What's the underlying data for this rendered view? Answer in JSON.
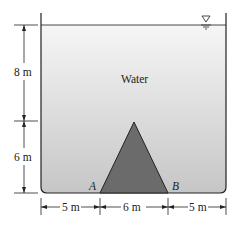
{
  "figure": {
    "fluid_label": "Water",
    "dimensions": {
      "upper_height": "8 m",
      "lower_height": "6 m",
      "left_width": "5 m",
      "middle_width": "6 m",
      "right_width": "5 m"
    },
    "points": {
      "left_base": "A",
      "right_base": "B"
    },
    "symbols": {
      "free_surface": "free-surface-triangle-icon"
    },
    "colors": {
      "water_top": "#f4f4f4",
      "water_bottom": "#c9c9c9",
      "obstacle": "#6b6b6b",
      "lines": "#222222"
    }
  }
}
